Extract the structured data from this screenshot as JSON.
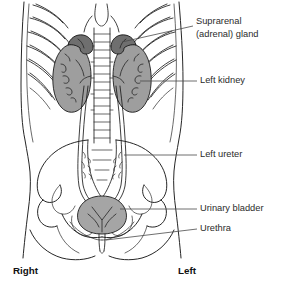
{
  "figure": {
    "view": "anterior view of abdomen and pelvis",
    "background_color": "#ffffff"
  },
  "colors": {
    "kidney_fill": "#9e9e9e",
    "adrenal_fill": "#6f6f6f",
    "bladder_fill": "#a5a5a5",
    "outline": "#1a1a1a",
    "leader_line": "#4a4a4a",
    "label_text": "#2b2b2b",
    "side_label_text": "#111111"
  },
  "labels": [
    {
      "id": "suprarenal-gland",
      "line1": "Suprarenal",
      "line2": "(adrenal) gland",
      "x": 196,
      "y": 24
    },
    {
      "id": "left-kidney",
      "line1": "Left kidney",
      "line2": "",
      "x": 200,
      "y": 81
    },
    {
      "id": "left-ureter",
      "line1": "Left ureter",
      "line2": "",
      "x": 200,
      "y": 155
    },
    {
      "id": "urinary-bladder",
      "line1": "Urinary bladder",
      "line2": "",
      "x": 200,
      "y": 209
    },
    {
      "id": "urethra",
      "line1": "Urethra",
      "line2": "",
      "x": 200,
      "y": 229
    }
  ],
  "side_labels": [
    {
      "id": "right",
      "text": "Right",
      "x": 13,
      "y": 271
    },
    {
      "id": "left",
      "text": "Left",
      "x": 178,
      "y": 271
    }
  ],
  "structures": [
    {
      "id": "right-kidney",
      "name": "Right kidney"
    },
    {
      "id": "left-kidney",
      "name": "Left kidney"
    },
    {
      "id": "right-suprarenal-gland",
      "name": "Right suprarenal (adrenal) gland"
    },
    {
      "id": "left-suprarenal-gland",
      "name": "Left suprarenal (adrenal) gland"
    },
    {
      "id": "right-ureter",
      "name": "Right ureter"
    },
    {
      "id": "left-ureter",
      "name": "Left ureter"
    },
    {
      "id": "urinary-bladder",
      "name": "Urinary bladder"
    },
    {
      "id": "urethra",
      "name": "Urethra"
    },
    {
      "id": "vertebral-column",
      "name": "Vertebral column"
    },
    {
      "id": "rib-cage",
      "name": "Rib cage"
    },
    {
      "id": "pelvis",
      "name": "Pelvis"
    },
    {
      "id": "sacrum",
      "name": "Sacrum"
    },
    {
      "id": "body-outline",
      "name": "Body outline"
    }
  ]
}
